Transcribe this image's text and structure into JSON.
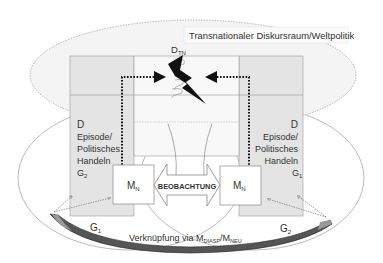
{
  "diagram": {
    "title_box": "Transnationaler Diskursraum/Weltpolitik",
    "top_node": {
      "main": "D",
      "sub": "TN"
    },
    "left_panel": {
      "line1": "D",
      "line2": "Episode/",
      "line3": "Politisches",
      "line4": "Handeln",
      "group_main": "G",
      "group_sub": "2"
    },
    "right_panel": {
      "line1": "D",
      "line2": "Episode/",
      "line3": "Politisches",
      "line4": "Handeln",
      "group_main": "G",
      "group_sub": "1"
    },
    "left_media": {
      "main": "M",
      "sub": "N"
    },
    "right_media": {
      "main": "M",
      "sub": "N"
    },
    "center_arrow": "BEOBACHTUNG",
    "left_group": {
      "main": "G",
      "sub": "1"
    },
    "right_group": {
      "main": "G",
      "sub": "2"
    },
    "bottom_link": {
      "prefix": "Verknüpfung via M",
      "sub1": "DIASP",
      "sep": "/M",
      "sub2": "NEU"
    },
    "colors": {
      "panel_fill": "#e4e4e4",
      "line": "#888888",
      "bolt": "#111111",
      "text": "#333333"
    }
  }
}
